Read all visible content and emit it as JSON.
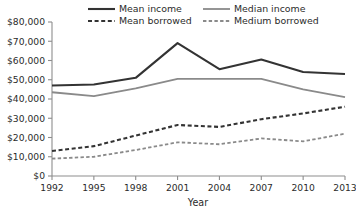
{
  "chart_data": {
    "type": "line",
    "title": "",
    "xlabel": "Year",
    "ylabel": "",
    "x": [
      1992,
      1995,
      1998,
      2001,
      2004,
      2007,
      2010,
      2013
    ],
    "xticklabels": [
      "1992",
      "1995",
      "1998",
      "2001",
      "2004",
      "2007",
      "2010",
      "2013"
    ],
    "yticklabels": [
      "$0",
      "$10,000",
      "$20,000",
      "$30,000",
      "$40,000",
      "$50,000",
      "$60,000",
      "$70,000",
      "$80,000"
    ],
    "ytickvalues": [
      0,
      10000,
      20000,
      30000,
      40000,
      50000,
      60000,
      70000,
      80000
    ],
    "ylim": [
      0,
      80000
    ],
    "xlim": [
      1992,
      2013
    ],
    "grid": false,
    "legend_position": "top",
    "series": [
      {
        "name": "Mean income",
        "style": "solid",
        "color": "#333333",
        "width": 2.1,
        "values": [
          47000,
          47500,
          51000,
          69000,
          55500,
          60500,
          54000,
          53000
        ]
      },
      {
        "name": "Median income",
        "style": "solid",
        "color": "#8a8a8a",
        "width": 1.8,
        "values": [
          43500,
          41500,
          45500,
          50500,
          50500,
          50500,
          45000,
          41000
        ]
      },
      {
        "name": "Mean borrowed",
        "style": "dashed",
        "color": "#333333",
        "width": 2.1,
        "values": [
          13000,
          15500,
          21000,
          26500,
          25500,
          29500,
          32500,
          36000
        ]
      },
      {
        "name": "Medium borrowed",
        "style": "dashed",
        "color": "#8a8a8a",
        "width": 1.8,
        "values": [
          9000,
          10000,
          13500,
          17500,
          16500,
          19500,
          18000,
          22000
        ]
      }
    ]
  },
  "legend": {
    "items": [
      {
        "label": "Mean income",
        "key": "mean-income"
      },
      {
        "label": "Median income",
        "key": "median-income"
      },
      {
        "label": "Mean borrowed",
        "key": "mean-borrowed"
      },
      {
        "label": "Medium borrowed",
        "key": "medium-borrowed"
      }
    ]
  },
  "axes": {
    "x_title": "Year"
  }
}
